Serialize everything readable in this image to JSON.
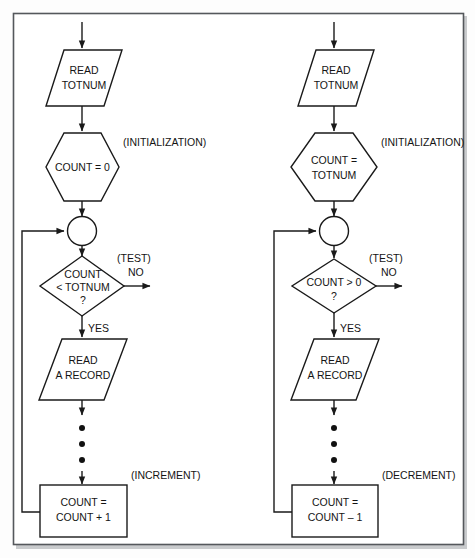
{
  "figure": {
    "frame_color": "#55585c",
    "line_color": "#1a1a1a",
    "background": "#fdfdfd"
  },
  "diagrams": [
    {
      "id": "increment-loop",
      "nodes": {
        "read_input": {
          "shape": "parallelogram",
          "line1": "READ",
          "line2": "TOTNUM"
        },
        "init": {
          "shape": "hexagon",
          "line1": "COUNT = 0",
          "line2": ""
        },
        "junction": {
          "shape": "circle",
          "label": ""
        },
        "test": {
          "shape": "diamond",
          "line1": "COUNT",
          "line2": "< TOTNUM",
          "line3": "?"
        },
        "process": {
          "shape": "parallelogram",
          "line1": "READ",
          "line2": "A RECORD"
        },
        "update": {
          "shape": "rectangle",
          "line1": "COUNT =",
          "line2": "COUNT + 1"
        }
      },
      "annotations": {
        "init": "(INITIALIZATION)",
        "test": "(TEST)",
        "update": "(INCREMENT)"
      },
      "branches": {
        "no": "NO",
        "yes": "YES"
      },
      "ellipsis_dots": 3
    },
    {
      "id": "decrement-loop",
      "nodes": {
        "read_input": {
          "shape": "parallelogram",
          "line1": "READ",
          "line2": "TOTNUM"
        },
        "init": {
          "shape": "hexagon",
          "line1": "COUNT =",
          "line2": "TOTNUM"
        },
        "junction": {
          "shape": "circle",
          "label": ""
        },
        "test": {
          "shape": "diamond",
          "line1": "COUNT > 0",
          "line2": "?",
          "line3": ""
        },
        "process": {
          "shape": "parallelogram",
          "line1": "READ",
          "line2": "A RECORD"
        },
        "update": {
          "shape": "rectangle",
          "line1": "COUNT =",
          "line2": "COUNT – 1"
        }
      },
      "annotations": {
        "init": "(INITIALIZATION)",
        "test": "(TEST)",
        "update": "(DECREMENT)"
      },
      "branches": {
        "no": "NO",
        "yes": "YES"
      },
      "ellipsis_dots": 3
    }
  ]
}
